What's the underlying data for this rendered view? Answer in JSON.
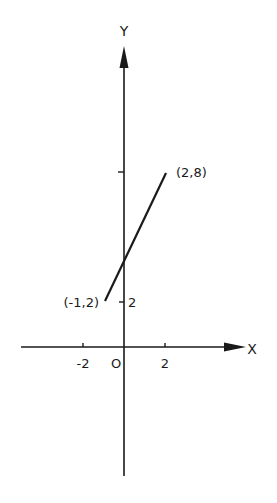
{
  "diagram": {
    "type": "coordinate-plane-line-segment",
    "axes": {
      "x_label": "X",
      "y_label": "Y",
      "origin_label": "O"
    },
    "x_ticks": [
      {
        "value": -2,
        "label": "-2"
      },
      {
        "value": 2,
        "label": "2"
      }
    ],
    "y_ticks": [
      {
        "value": 2,
        "label": "2"
      },
      {
        "value": 8,
        "label": ""
      }
    ],
    "segment": {
      "start": {
        "x": -1,
        "y": 2,
        "label": "(-1,2)"
      },
      "end": {
        "x": 2,
        "y": 8,
        "label": "(2,8)"
      }
    },
    "colors": {
      "ink": "#1a1a1a",
      "background": "#ffffff"
    }
  }
}
